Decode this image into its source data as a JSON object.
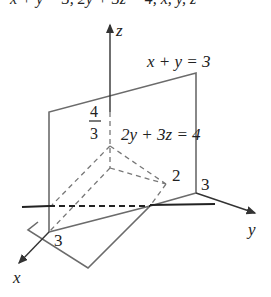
{
  "header": {
    "partial_text": "x + y = 3, 2y + 3z = 4, x, y, z"
  },
  "diagram": {
    "axes": {
      "x_label": "x",
      "y_label": "y",
      "z_label": "z"
    },
    "planes": {
      "plane1_label": "x + y = 3",
      "plane2_label": "2y + 3z = 4"
    },
    "intercepts": {
      "z_intercept_num": "4",
      "z_intercept_den": "3",
      "y_intercept_plane2": "2",
      "y_intercept_plane1": "3",
      "x_intercept_plane1": "3"
    },
    "colors": {
      "plane_edge": "#6b6b6b",
      "axis": "#333333",
      "dashed": "#777777"
    }
  }
}
